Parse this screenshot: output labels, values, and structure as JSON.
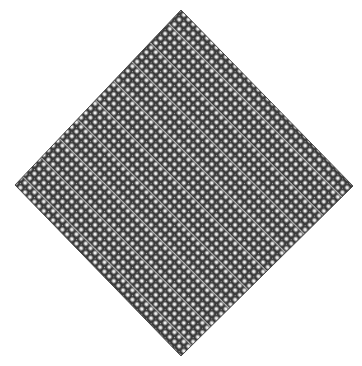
{
  "figure": {
    "title": "Diamond lattice pattern",
    "shape": "diamond",
    "vertices": {
      "top": [
        181,
        10
      ],
      "right": [
        353,
        186
      ],
      "bottom": [
        181,
        356
      ],
      "left": [
        15,
        185
      ]
    },
    "background_color": "#ffffff",
    "ink_color": "#3a3a3a",
    "mid_color": "#8a8a8a",
    "hole_color": "#f2f2f2",
    "cell_period_px": 6.6,
    "diagonal_stripe_every": 4
  }
}
